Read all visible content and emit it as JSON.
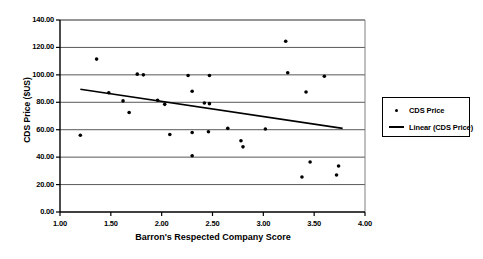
{
  "chart_data": {
    "type": "scatter",
    "title": "",
    "xlabel": "Barron's Respected Company Score",
    "ylabel": "CDS Price ($US)",
    "xlim": [
      1.0,
      4.0
    ],
    "ylim": [
      0.0,
      140.0
    ],
    "xticks": [
      "1.00",
      "1.50",
      "2.00",
      "2.50",
      "3.00",
      "3.50",
      "4.00"
    ],
    "xtick_values": [
      1.0,
      1.5,
      2.0,
      2.5,
      3.0,
      3.5,
      4.0
    ],
    "yticks": [
      "0.00",
      "20.00",
      "40.00",
      "60.00",
      "80.00",
      "100.00",
      "120.00",
      "140.00"
    ],
    "ytick_values": [
      0,
      20,
      40,
      60,
      80,
      100,
      120,
      140
    ],
    "grid": "horizontal",
    "legend_position": "right",
    "series": [
      {
        "name": "CDS Price",
        "type": "scatter",
        "marker": "dot",
        "color": "#000000",
        "points": [
          {
            "x": 1.2,
            "y": 56.0
          },
          {
            "x": 1.36,
            "y": 111.5
          },
          {
            "x": 1.48,
            "y": 87.0
          },
          {
            "x": 1.62,
            "y": 81.0
          },
          {
            "x": 1.68,
            "y": 72.5
          },
          {
            "x": 1.76,
            "y": 100.5
          },
          {
            "x": 1.82,
            "y": 100.0
          },
          {
            "x": 1.96,
            "y": 81.5
          },
          {
            "x": 2.03,
            "y": 78.5
          },
          {
            "x": 2.08,
            "y": 56.5
          },
          {
            "x": 2.26,
            "y": 99.5
          },
          {
            "x": 2.3,
            "y": 88.0
          },
          {
            "x": 2.3,
            "y": 58.0
          },
          {
            "x": 2.3,
            "y": 41.0
          },
          {
            "x": 2.42,
            "y": 79.5
          },
          {
            "x": 2.47,
            "y": 99.5
          },
          {
            "x": 2.47,
            "y": 79.0
          },
          {
            "x": 2.46,
            "y": 58.5
          },
          {
            "x": 2.65,
            "y": 61.0
          },
          {
            "x": 2.78,
            "y": 52.0
          },
          {
            "x": 2.8,
            "y": 47.5
          },
          {
            "x": 3.02,
            "y": 60.5
          },
          {
            "x": 3.22,
            "y": 124.5
          },
          {
            "x": 3.24,
            "y": 101.5
          },
          {
            "x": 3.38,
            "y": 25.5
          },
          {
            "x": 3.42,
            "y": 87.5
          },
          {
            "x": 3.46,
            "y": 36.5
          },
          {
            "x": 3.6,
            "y": 99.0
          },
          {
            "x": 3.72,
            "y": 27.0
          },
          {
            "x": 3.74,
            "y": 33.5
          }
        ]
      },
      {
        "name": "Linear (CDS Price)",
        "type": "line",
        "color": "#000000",
        "points": [
          {
            "x": 1.2,
            "y": 89.5
          },
          {
            "x": 3.78,
            "y": 61.0
          }
        ]
      }
    ],
    "legend": [
      {
        "label": "CDS Price",
        "marker": "dot"
      },
      {
        "label": "Linear (CDS Price)",
        "marker": "line"
      }
    ]
  }
}
